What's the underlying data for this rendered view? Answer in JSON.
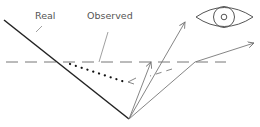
{
  "diagram": {
    "type": "optics-refraction-illustration",
    "labels": {
      "real": "Real",
      "observed": "Observed"
    },
    "elements": {
      "surface_line": "solid diagonal line representing the real object edge",
      "water_line": "horizontal dashed line representing the interface",
      "observed_path": "dotted line representing the apparent (observed) position",
      "rays": [
        "ray from apex to upper left arrow",
        "ray from apex refracted toward the eye"
      ],
      "eye": "eye icon observer at upper right"
    },
    "colors": {
      "background": "#ffffff",
      "line_primary": "#222222",
      "line_secondary": "#777777",
      "label_text": "#555555"
    }
  }
}
